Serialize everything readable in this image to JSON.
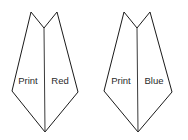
{
  "diagram": {
    "background_color": "#ffffff",
    "stroke_color": "#1a1a1a",
    "divider_color": "#3a3a3a",
    "label_color": "#2b2b2b",
    "shapes": [
      {
        "id": "left-shape",
        "name": "print-red-banner",
        "outline_points": "31,12 44,28 57,12 78,92 45,132 12,91",
        "divider": {
          "x1": 44,
          "y1": 28,
          "x2": 45,
          "y2": 132
        },
        "segments": [
          {
            "id": "left-segment",
            "label": "Print",
            "label_x": 28,
            "label_y": 81
          },
          {
            "id": "right-segment",
            "label": "Red",
            "label_x": 60,
            "label_y": 81
          }
        ]
      },
      {
        "id": "right-shape",
        "name": "print-blue-banner",
        "outline_points": "124,12 137,28 150,12 172,92 138,132 104,91",
        "divider": {
          "x1": 137,
          "y1": 28,
          "x2": 138,
          "y2": 132
        },
        "segments": [
          {
            "id": "left-segment",
            "label": "Print",
            "label_x": 121,
            "label_y": 81
          },
          {
            "id": "right-segment",
            "label": "Blue",
            "label_x": 154,
            "label_y": 81
          }
        ]
      }
    ]
  }
}
